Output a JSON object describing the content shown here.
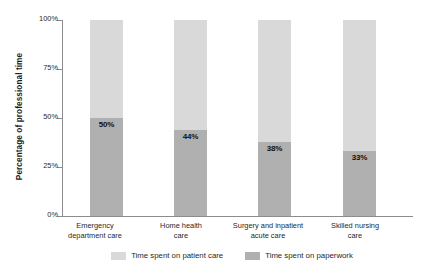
{
  "chart_data": {
    "type": "bar",
    "subtype": "stacked-100-percent",
    "title": "",
    "xlabel": "",
    "ylabel": "Percentage of professional time",
    "ylim": [
      0,
      100
    ],
    "ytick_labels": [
      "0%",
      "25%",
      "50%",
      "75%",
      "100%"
    ],
    "ytick_values": [
      0,
      25,
      50,
      75,
      100
    ],
    "grid": false,
    "legend_position": "bottom",
    "categories": [
      "Emergency department care",
      "Home health care",
      "Surgery and inpatient acute care",
      "Skilled nursing care"
    ],
    "category_lines": [
      [
        "Emergency",
        "department care"
      ],
      [
        "Home health",
        "care"
      ],
      [
        "Surgery and inpatient",
        "acute care"
      ],
      [
        "Skilled nursing",
        "care"
      ]
    ],
    "series": [
      {
        "name": "Time spent on patient care",
        "color": "#d9d9d9",
        "values": [
          50,
          56,
          62,
          67
        ],
        "labels": [
          "",
          "",
          "",
          ""
        ]
      },
      {
        "name": "Time spent on paperwork",
        "color": "#b0b0b0",
        "values": [
          50,
          44,
          38,
          33
        ],
        "labels": [
          "50%",
          "44%",
          "38%",
          "33%"
        ]
      }
    ]
  },
  "legend": [
    {
      "label": "Time spent on patient care",
      "color": "#d9d9d9"
    },
    {
      "label": "Time spent on paperwork",
      "color": "#b0b0b0"
    }
  ],
  "axis": {
    "color": "#8c8c8c"
  }
}
